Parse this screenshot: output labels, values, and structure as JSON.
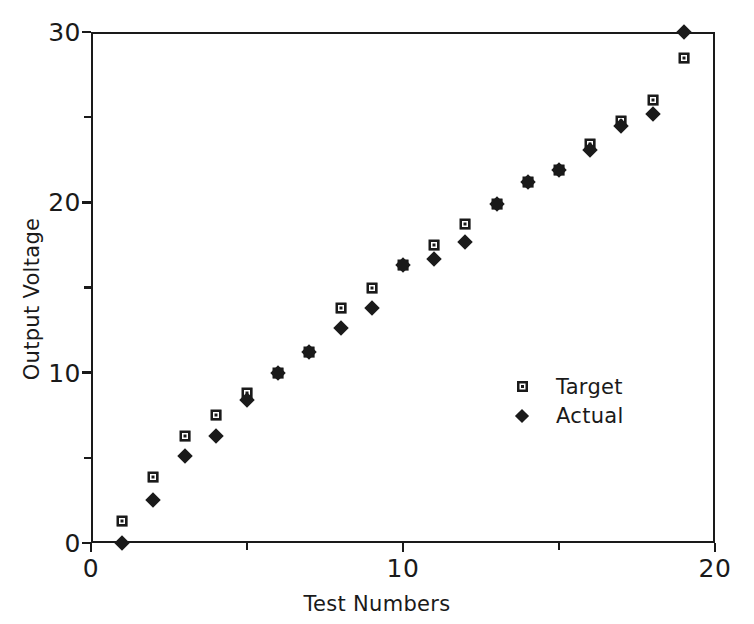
{
  "chart_data": {
    "type": "scatter",
    "title": "",
    "xlabel": "Test Numbers",
    "ylabel": "Output Voltage",
    "xlim": [
      0,
      20
    ],
    "ylim": [
      0,
      30
    ],
    "grid": false,
    "legend_position": "center-right",
    "x_ticks_major": [
      0,
      10,
      20
    ],
    "x_ticks_minor": [
      5,
      15
    ],
    "y_ticks_major": [
      0,
      10,
      20,
      30
    ],
    "y_ticks_minor": [
      5,
      15,
      25
    ],
    "x_tick_labels": [
      "0",
      "10",
      "20"
    ],
    "y_tick_labels": [
      "0",
      "10",
      "20",
      "30"
    ],
    "x": [
      1,
      2,
      3,
      4,
      5,
      6,
      7,
      8,
      9,
      10,
      11,
      12,
      13,
      14,
      15,
      16,
      17,
      18,
      19
    ],
    "series": [
      {
        "name": "Target",
        "marker": "square",
        "color": "#1a1a1a",
        "values": [
          1.3,
          3.9,
          6.3,
          7.5,
          8.8,
          10.0,
          11.2,
          13.8,
          15.0,
          16.3,
          17.5,
          18.7,
          19.9,
          21.2,
          21.9,
          23.4,
          24.8,
          26.0,
          28.5
        ]
      },
      {
        "name": "Actual",
        "marker": "diamond",
        "color": "#1a1a1a",
        "values": [
          0.0,
          2.5,
          5.1,
          6.3,
          8.4,
          10.0,
          11.2,
          12.6,
          13.8,
          16.3,
          16.7,
          17.7,
          19.9,
          21.2,
          21.9,
          23.1,
          24.5,
          25.2,
          30.0
        ]
      }
    ]
  },
  "axes": {
    "x_title": "Test Numbers",
    "y_title": "Output Voltage"
  },
  "legend": {
    "items": [
      {
        "label": "Target",
        "marker": "square"
      },
      {
        "label": "Actual",
        "marker": "diamond"
      }
    ]
  }
}
